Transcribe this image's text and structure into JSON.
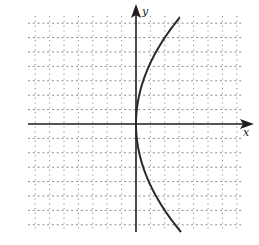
{
  "chart_data": {
    "type": "line",
    "title": "",
    "xlabel": "x",
    "ylabel": "y",
    "xlim": [
      -7.5,
      7.5
    ],
    "ylim": [
      -7.5,
      7.5
    ],
    "grid": true,
    "grid_style": "dotted",
    "legend": null,
    "series": [
      {
        "name": "parabola opening right (x = y^2/18)",
        "equation": "x = y^2 / 18",
        "y_range": [
          -7.5,
          7.4
        ],
        "vertex": [
          0,
          0
        ],
        "points": [
          {
            "x": 3.0,
            "y": 7.4
          },
          {
            "x": 2.0,
            "y": 6.0
          },
          {
            "x": 0.9,
            "y": 4.0
          },
          {
            "x": 0.2,
            "y": 2.0
          },
          {
            "x": 0.0,
            "y": 0.0
          },
          {
            "x": 0.2,
            "y": -2.0
          },
          {
            "x": 0.9,
            "y": -4.0
          },
          {
            "x": 2.0,
            "y": -6.0
          },
          {
            "x": 2.7,
            "y": -7.5
          }
        ]
      }
    ]
  },
  "labels": {
    "x_axis": "x",
    "y_axis": "y"
  },
  "colors": {
    "curve": "#2a2a2a",
    "axes": "#1e1e1e",
    "grid": "#8a8a8a"
  }
}
